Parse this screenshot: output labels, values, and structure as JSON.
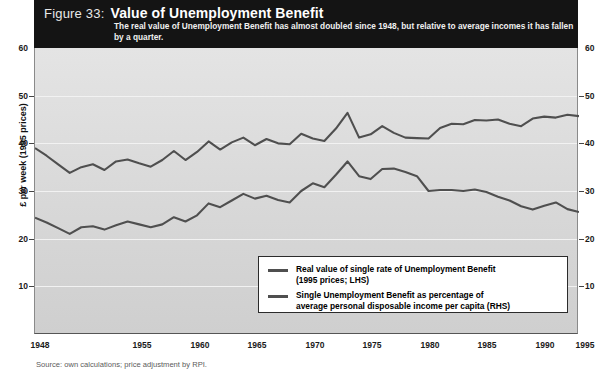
{
  "header": {
    "figure_number": "Figure 33:",
    "title": "Value of Unemployment Benefit",
    "subtitle": "The real value of Unemployment Benefit has almost doubled since 1948, but relative to average incomes it has fallen by a quarter."
  },
  "axes": {
    "left_title": "£ per week (1995 prices)",
    "right_title": "Percentage of average personal disposable income per capita",
    "y_ticks": [
      "10",
      "20",
      "30",
      "40",
      "50",
      "60"
    ],
    "y_ticks_right": [
      "10",
      "20",
      "30",
      "40",
      "50",
      "60"
    ],
    "x_ticks": [
      "1948",
      "1955",
      "1960",
      "1965",
      "1970",
      "1975",
      "1980",
      "1985",
      "1990",
      "1995"
    ]
  },
  "legend": {
    "items": [
      {
        "line1": "Real value of single rate of Unemployment Benefit",
        "line2": "(1995 prices; LHS)",
        "color": "#4f4f4f"
      },
      {
        "line1": "Single Unemployment Benefit as percentage of",
        "line2": "average personal disposable income per capita (RHS)",
        "color": "#4f4f4f"
      }
    ]
  },
  "source": "Source: own calculations; price adjustment by RPI.",
  "chart_data": {
    "type": "line",
    "title": "Value of Unemployment Benefit",
    "subtitle": "The real value of Unemployment Benefit has almost doubled since 1948, but relative to average incomes it has fallen by a quarter.",
    "xlabel": "",
    "ylabel": "£ per week (1995 prices)",
    "ylabel_right": "Percentage of average personal disposable income per capita",
    "xlim": [
      1948,
      1995
    ],
    "ylim": [
      0,
      60
    ],
    "ylim_right": [
      0,
      60
    ],
    "grid": true,
    "legend_position": "bottom-right",
    "x": [
      1948,
      1949,
      1950,
      1951,
      1952,
      1953,
      1954,
      1955,
      1956,
      1957,
      1958,
      1959,
      1960,
      1961,
      1962,
      1963,
      1964,
      1965,
      1966,
      1967,
      1968,
      1969,
      1970,
      1971,
      1972,
      1973,
      1974,
      1975,
      1976,
      1977,
      1978,
      1979,
      1980,
      1981,
      1982,
      1983,
      1984,
      1985,
      1986,
      1987,
      1988,
      1989,
      1990,
      1991,
      1992,
      1993,
      1994,
      1995
    ],
    "series": [
      {
        "name": "Real value of single rate of Unemployment Benefit (1995 prices; LHS)",
        "axis": "left",
        "color": "#4f4f4f",
        "units": "£ per week (1995 prices)",
        "values": [
          39.0,
          37.4,
          35.6,
          33.8,
          35.0,
          35.6,
          34.4,
          36.2,
          36.6,
          35.8,
          35.1,
          36.5,
          38.4,
          36.5,
          38.2,
          40.4,
          38.7,
          40.2,
          41.2,
          39.6,
          40.9,
          40.0,
          39.8,
          42.0,
          41.0,
          40.5,
          43.1,
          46.4,
          41.2,
          41.9,
          43.6,
          42.2,
          41.2,
          41.1,
          41.0,
          43.2,
          44.1,
          44.0,
          44.9,
          44.8,
          45.0,
          44.1,
          43.6,
          45.2,
          45.6,
          45.4,
          46.0,
          45.7
        ]
      },
      {
        "name": "Single Unemployment Benefit as percentage of average personal disposable income per capita (RHS)",
        "axis": "right",
        "color": "#4f4f4f",
        "units": "percentage",
        "values": [
          24.4,
          23.4,
          22.2,
          21.0,
          22.4,
          22.6,
          21.9,
          22.8,
          23.6,
          23.0,
          22.4,
          23.0,
          24.5,
          23.6,
          24.9,
          27.4,
          26.6,
          28.0,
          29.4,
          28.4,
          29.0,
          28.1,
          27.6,
          30.0,
          31.6,
          30.8,
          33.4,
          36.2,
          33.1,
          32.5,
          34.6,
          34.7,
          34.0,
          33.1,
          30.0,
          30.2,
          30.2,
          30.0,
          30.3,
          29.8,
          28.8,
          28.0,
          26.8,
          26.1,
          26.9,
          27.6,
          26.2,
          25.6
        ]
      }
    ]
  }
}
